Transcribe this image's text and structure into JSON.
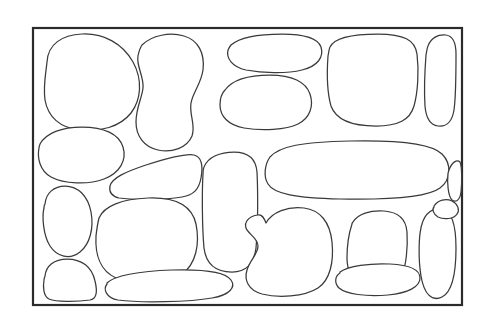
{
  "document": {
    "title": "Stone Wall Line Art",
    "kind": "line-drawing",
    "subject": "cobblestone-wall-outline",
    "background_color": "#ffffff"
  },
  "canvas": {
    "width": 480,
    "height": 329
  },
  "frame": {
    "name": "outer-rectangle-border",
    "x": 33,
    "y": 28,
    "width": 429,
    "height": 277,
    "stroke_color": "#2b2b2b",
    "stroke_width": 2.2,
    "fill_color": "#ffffff"
  },
  "style": {
    "stone_stroke_color": "#3a3a3a",
    "stone_stroke_width": 1.25,
    "stone_fill_color": "#ffffff"
  },
  "shapes": [
    {
      "id": "stone-01",
      "label": "large rounded stone, top left",
      "row": "top",
      "column": "left",
      "path": "M 47 62 C 48 44 62 35 82 34 C 104 33 123 44 133 62 C 143 80 141 100 131 113 C 120 127 100 132 80 130 C 60 128 48 117 45 100 C 43 86 46 72 47 62 Z"
    },
    {
      "id": "stone-02",
      "label": "tall kidney stone, top center-left",
      "row": "top",
      "column": "center-left",
      "path": "M 142 45 C 152 35 170 32 184 36 C 198 40 205 53 203 70 C 201 84 193 92 191 103 C 189 115 196 125 192 136 C 187 148 172 153 158 150 C 144 147 136 136 136 122 C 136 108 142 98 143 88 C 144 76 136 66 138 56 C 139 51 140 48 142 45 Z"
    },
    {
      "id": "stone-03",
      "label": "wide flat stone, top center",
      "row": "top",
      "column": "center",
      "path": "M 231 45 C 240 37 258 34 282 34 C 306 34 318 38 321 47 C 324 57 318 66 302 70 C 286 74 262 73 246 70 C 232 67 226 58 228 50 C 229 48 230 46 231 45 Z"
    },
    {
      "id": "stone-04",
      "label": "rounded square stone, top center-right",
      "row": "top",
      "column": "center-right",
      "path": "M 225 90 C 232 80 248 75 270 75 C 292 75 306 82 310 94 C 314 106 310 118 298 124 C 286 130 262 131 244 128 C 228 125 220 116 220 105 C 220 98 222 93 225 90 Z"
    },
    {
      "id": "stone-05",
      "label": "large block stone, top right",
      "row": "top",
      "column": "right",
      "path": "M 330 47 C 334 38 350 34 378 34 C 404 34 415 40 417 54 C 419 70 418 92 414 106 C 410 120 398 126 376 126 C 352 126 336 120 331 106 C 327 92 327 70 328 56 C 329 51 329 49 330 47 Z"
    },
    {
      "id": "stone-06",
      "label": "narrow vertical stone, far top right",
      "row": "top",
      "column": "far-right",
      "path": "M 428 46 C 431 38 438 34 446 35 C 453 36 456 42 456 54 C 456 72 456 96 454 110 C 452 122 446 127 438 126 C 430 125 426 118 425 106 C 424 90 425 68 426 55 C 427 50 427 48 428 46 Z"
    },
    {
      "id": "stone-07",
      "label": "wide ellipse stone, left middle",
      "row": "middle",
      "column": "left",
      "path": "M 40 144 C 46 133 62 127 82 127 C 104 127 119 134 123 147 C 127 160 120 173 104 179 C 88 185 64 184 51 177 C 40 171 37 158 39 148 C 39 146 40 145 40 144 Z"
    },
    {
      "id": "stone-08",
      "label": "wedge stone, left-center middle",
      "row": "middle",
      "column": "center-left",
      "path": "M 110 186 C 112 178 125 172 146 165 C 168 158 186 153 194 155 C 202 157 203 167 201 178 C 199 189 194 195 182 197 C 164 200 132 200 119 198 C 111 196 109 191 110 186 Z"
    },
    {
      "id": "stone-09",
      "label": "tall rounded stone, center column",
      "row": "middle",
      "column": "center",
      "path": "M 204 167 C 208 157 220 152 234 152 C 248 152 256 159 257 172 C 258 192 258 228 256 248 C 254 264 246 272 232 272 C 216 272 206 264 204 248 C 202 226 202 190 203 174 C 203 171 203 169 204 167 Z"
    },
    {
      "id": "stone-10",
      "label": "very wide horizontal stone, right middle",
      "row": "middle",
      "column": "right",
      "path": "M 270 157 C 280 146 302 142 350 141 C 400 140 432 144 442 154 C 452 164 451 180 440 188 C 428 197 392 200 340 199 C 296 198 274 194 268 184 C 263 176 265 164 270 157 Z"
    },
    {
      "id": "stone-11",
      "label": "narrow oval stone, far right middle",
      "row": "middle",
      "column": "far-right",
      "path": "M 449 170 C 452 162 457 159 460 162 C 462 166 462 182 461 192 C 460 200 456 203 452 200 C 448 196 447 182 448 174 C 448 172 449 171 449 170 Z"
    },
    {
      "id": "stone-12",
      "label": "tall oval stone, left lower-middle",
      "row": "lower-middle",
      "column": "left",
      "path": "M 45 204 C 46 193 54 186 65 186 C 78 186 88 196 91 212 C 94 228 90 244 80 252 C 70 260 57 257 50 246 C 43 235 42 216 44 208 C 44 206 44 205 45 204 Z"
    },
    {
      "id": "stone-13",
      "label": "large rounded stone, lower-middle center-left",
      "row": "lower-middle",
      "column": "center-left",
      "path": "M 99 218 C 104 206 122 199 148 198 C 176 197 192 206 196 224 C 200 244 196 264 182 274 C 166 285 134 286 116 278 C 100 271 95 254 96 236 C 97 227 98 222 99 218 Z"
    },
    {
      "id": "stone-14",
      "label": "irregular boot-shaped stone, bottom center",
      "row": "bottom",
      "column": "center",
      "path": "M 266 223 C 272 212 288 206 304 208 C 320 210 330 222 332 242 C 334 262 330 280 318 288 C 304 297 278 298 262 294 C 248 290 244 280 247 270 C 250 260 258 254 258 246 C 258 238 248 234 246 228 C 244 222 249 216 258 215 C 262 214 264 218 266 223 Z"
    },
    {
      "id": "stone-15",
      "label": "trapezoid stone, bottom center-right",
      "row": "bottom",
      "column": "center-right",
      "path": "M 353 222 C 358 214 370 210 384 211 C 398 212 406 219 407 232 C 408 248 406 266 402 274 C 398 281 382 283 366 281 C 352 279 347 272 347 258 C 347 244 350 230 352 224 C 352 223 353 222 353 222 Z"
    },
    {
      "id": "stone-16",
      "label": "tall narrow oval stone, bottom right",
      "row": "bottom",
      "column": "right",
      "path": "M 422 224 C 425 213 433 207 442 209 C 452 211 456 224 456 248 C 456 272 452 292 442 297 C 432 302 424 294 421 276 C 418 258 419 236 421 228 C 421 226 422 225 422 224 Z"
    },
    {
      "id": "stone-17",
      "label": "rounded square stone, bottom left",
      "row": "bottom",
      "column": "left",
      "path": "M 45 276 C 46 266 54 259 67 259 C 82 259 92 267 95 281 C 98 293 96 299 90 300 C 76 302 56 302 49 299 C 43 296 43 286 44 280 C 44 278 45 277 45 276 Z"
    },
    {
      "id": "stone-18",
      "label": "long thin horizontal stone, bottom left-center",
      "row": "bottom",
      "column": "center-left",
      "path": "M 107 283 C 114 276 138 271 172 270 C 206 269 226 273 231 280 C 236 287 230 295 212 298 C 190 302 140 303 118 300 C 106 298 103 289 107 284 C 107 284 107 283 107 283 Z"
    },
    {
      "id": "stone-19",
      "label": "flat oval stone, bottom center-right",
      "row": "bottom",
      "column": "center",
      "path": "M 340 272 C 348 266 370 263 390 264 C 410 265 420 270 420 278 C 420 287 408 293 388 295 C 366 297 346 294 339 288 C 334 283 335 276 340 273 C 340 273 340 272 340 272 Z"
    },
    {
      "id": "stone-20",
      "label": "curved filler stone, right lower-middle",
      "row": "lower-middle",
      "column": "far-right",
      "path": "M 434 206 C 438 200 446 198 452 201 C 458 204 460 210 457 214 C 454 219 444 220 438 217 C 433 214 432 209 434 207 C 434 207 434 206 434 206 Z"
    }
  ]
}
